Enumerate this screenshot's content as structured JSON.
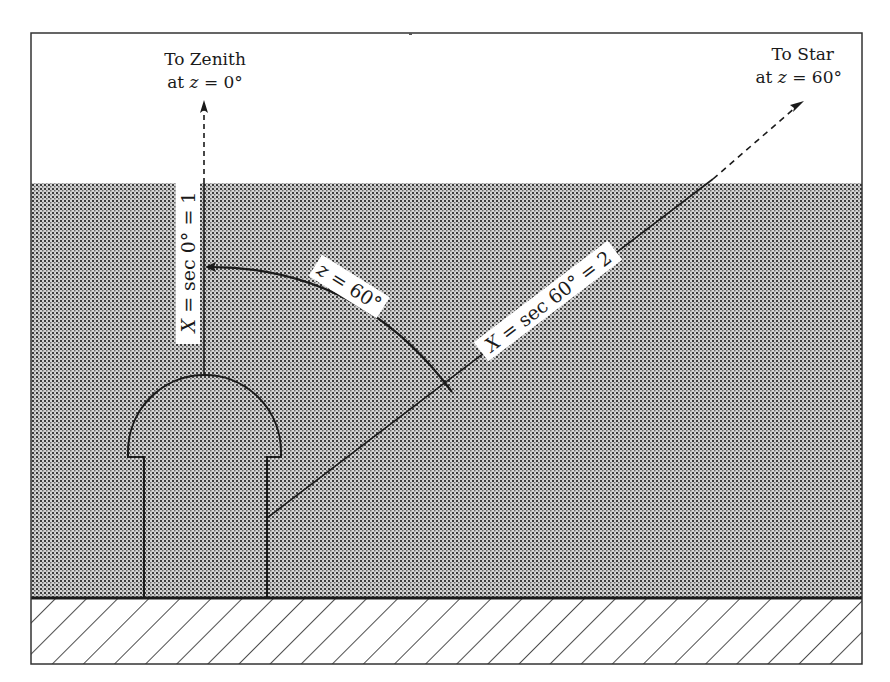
{
  "diagram": {
    "zenith_label": {
      "line1": "To Zenith",
      "line2_prefix": "at ",
      "line2_var": "z",
      "line2_suffix": " = 0°"
    },
    "star_label": {
      "line1": "To Star",
      "line2_prefix": "at ",
      "line2_var": "z",
      "line2_suffix": " = 60°"
    },
    "zenith_path_label": {
      "var": "X",
      "text": " = sec 0° = 1"
    },
    "star_path_label": {
      "var": "X",
      "text": " = sec 60° = 2"
    },
    "angle_label": {
      "var": "z",
      "text": " = 60°"
    },
    "elements": {
      "atmosphere": "stippled shaded layer",
      "ground": "diagonal hatched ground",
      "observatory": "domed observatory building"
    },
    "colors": {
      "stroke": "#1a1a1a",
      "atmosphere_bg": "#cfcfcf",
      "atmosphere_dot": "#3a3a3a",
      "label_bg": "#ffffff"
    }
  }
}
